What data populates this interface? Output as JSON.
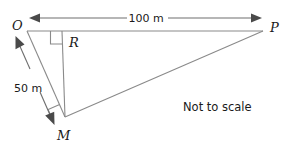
{
  "diagram": {
    "note": "Not to scale",
    "stroke_color": "#8a8a8a",
    "text_color": "#1a1a1a",
    "background": "#ffffff",
    "vertices": [
      {
        "id": "O",
        "label": "O",
        "x": 27,
        "y": 31,
        "label_x": 17,
        "label_y": 28
      },
      {
        "id": "P",
        "label": "P",
        "x": 263,
        "y": 31,
        "label_x": 272,
        "label_y": 30
      },
      {
        "id": "R",
        "label": "R",
        "x": 62,
        "y": 31,
        "label_x": 71,
        "label_y": 43
      },
      {
        "id": "M",
        "label": "M",
        "x": 65,
        "y": 117,
        "label_x": 60,
        "label_y": 139
      }
    ],
    "segments": [
      {
        "id": "OP",
        "from": "O",
        "to": "P"
      },
      {
        "id": "RM",
        "from": "R",
        "to": "M"
      },
      {
        "id": "OM",
        "from": "O",
        "to": "M"
      },
      {
        "id": "MP",
        "from": "M",
        "to": "P"
      }
    ],
    "right_angles": [
      {
        "id": "angle-at-R",
        "at": "R",
        "between": "RO and RM"
      },
      {
        "id": "angle-at-M",
        "at": "M",
        "between": "MR and MP"
      }
    ],
    "dimensions": [
      {
        "id": "OP-dimension",
        "label": "100 m",
        "measures": "OP",
        "label_x": 146,
        "label_y": 22,
        "arrow_style": "double-headed"
      },
      {
        "id": "OM-dimension",
        "label": "50 m",
        "measures": "OM",
        "label_x": 29,
        "label_y": 92,
        "arrow_style": "double-headed"
      }
    ],
    "note_x": 228,
    "note_y": 107
  }
}
